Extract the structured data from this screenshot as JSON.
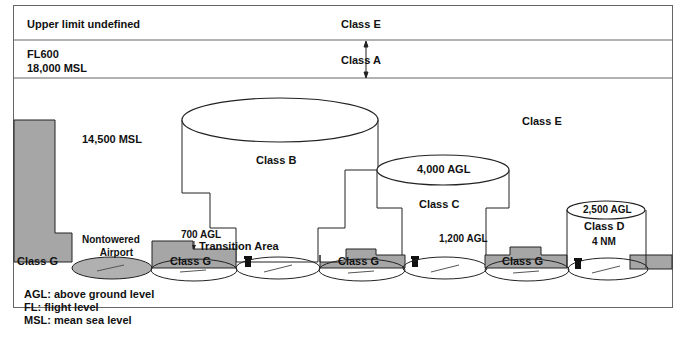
{
  "header_bands": {
    "upper": {
      "left_label": "Upper limit undefined",
      "class_label": "Class E"
    },
    "class_a": {
      "left_line1": "FL600",
      "left_line2": "18,000 MSL",
      "class_label": "Class A"
    }
  },
  "diagram": {
    "class_e_label": "Class E",
    "msl_14500_label": "14,500 MSL",
    "class_b": {
      "label": "Class B"
    },
    "class_c": {
      "label": "Class C",
      "ceiling": "4,000 AGL"
    },
    "class_d": {
      "label": "Class D",
      "radius": "4 NM",
      "ceiling": "2,500 AGL"
    },
    "class_g_labels": [
      "Class G",
      "Class G",
      "Class G",
      "Class G"
    ],
    "nontowered_airport": {
      "line1": "Nontowered",
      "line2": "Airport"
    },
    "agl_700": "700 AGL",
    "transition_area": "Transition Area",
    "agl_1200": "1,200 AGL"
  },
  "legend": {
    "items": [
      {
        "abbr": "AGL:",
        "text": "above ground level"
      },
      {
        "abbr": "FL:",
        "text": "flight level"
      },
      {
        "abbr": "MSL:",
        "text": "mean sea level"
      }
    ]
  },
  "colors": {
    "class_g_fill": "#a6a6a6",
    "line": "#1a1a1a",
    "frame": "#666666"
  }
}
